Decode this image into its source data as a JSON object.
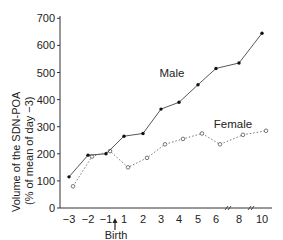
{
  "chart_data": {
    "type": "line",
    "title": "",
    "xlabel": "",
    "ylabel": "Volume of the SDN-POA",
    "ylabel_sub": "(% of mean of day −3)",
    "x_tick_labels": [
      "−3",
      "−2",
      "−1",
      "1",
      "2",
      "3",
      "4",
      "5",
      "6",
      "8",
      "10"
    ],
    "x": [
      -3,
      -2,
      -1,
      1,
      2,
      3,
      4,
      5,
      6,
      8,
      10
    ],
    "y_ticks": [
      0,
      100,
      200,
      300,
      400,
      500,
      600,
      700
    ],
    "ylim": [
      0,
      700
    ],
    "grid": false,
    "axis_breaks_after": [
      "6",
      "8"
    ],
    "annotation": {
      "label": "Birth",
      "marker": "up-arrow",
      "position_between": [
        "−1",
        "1"
      ]
    },
    "series": [
      {
        "name": "Male",
        "style": "solid",
        "marker": "filled-dot",
        "values": [
          115,
          195,
          200,
          265,
          275,
          365,
          390,
          455,
          515,
          535,
          645
        ]
      },
      {
        "name": "Female",
        "style": "dotted",
        "marker": "open-circle",
        "values": [
          80,
          190,
          210,
          150,
          185,
          235,
          255,
          275,
          235,
          270,
          285
        ]
      }
    ],
    "legend": {
      "position": "inline-labels",
      "entries": [
        "Male",
        "Female"
      ]
    }
  },
  "labels": {
    "male": "Male",
    "female": "Female",
    "birth": "Birth",
    "ylabel_line1": "Volume of the SDN-POA",
    "ylabel_line2": "(% of mean of day −3)"
  }
}
